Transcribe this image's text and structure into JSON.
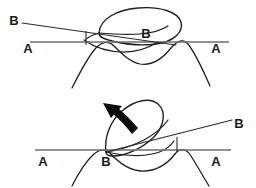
{
  "figure": {
    "background_color": "#ffffff",
    "ink_color": "#1d1d1d",
    "axis_color": "#6f6f6f",
    "panels": [
      {
        "id": "top-panel",
        "name": "upper-diagram",
        "description": "Closed loop resting on a wavy contour with a shallow tilted B line crossing horizontal A line",
        "labels": [
          {
            "id": "top-b-left",
            "text": "B",
            "x": 14,
            "y": 22
          },
          {
            "id": "top-a-left",
            "text": "A",
            "x": 28,
            "y": 50
          },
          {
            "id": "top-b-loop",
            "text": "B",
            "x": 146,
            "y": 35
          },
          {
            "id": "top-a-right",
            "text": "A",
            "x": 216,
            "y": 50
          }
        ],
        "a_line": {
          "x1": 30,
          "y1": 42,
          "x2": 229,
          "y2": 42
        },
        "b_line": {
          "x1": 22,
          "y1": 23,
          "x2": 176,
          "y2": 45
        },
        "tick": {
          "x": 86,
          "y1": 31,
          "y2": 45
        },
        "arrow": null
      },
      {
        "id": "bottom-panel",
        "name": "lower-diagram",
        "description": "Same loop rotated upright with a curved arrow indicating counterclockwise rotation, B line steeply tilted",
        "labels": [
          {
            "id": "bot-a-left",
            "text": "A",
            "x": 43,
            "y": 163
          },
          {
            "id": "bot-b-vertex",
            "text": "B",
            "x": 106,
            "y": 163
          },
          {
            "id": "bot-b-right",
            "text": "B",
            "x": 239,
            "y": 125
          },
          {
            "id": "bot-a-right",
            "text": "A",
            "x": 216,
            "y": 163
          }
        ],
        "a_line": {
          "x1": 35,
          "y1": 150,
          "x2": 231,
          "y2": 150
        },
        "b_line": {
          "x1": 106,
          "y1": 152,
          "x2": 232,
          "y2": 120
        },
        "tick": {
          "x": 177,
          "y1": 137,
          "y2": 152
        },
        "arrow": {
          "id": "rotation-arrow",
          "direction": "counterclockwise-up-left",
          "tip_x": 104,
          "tip_y": 104
        }
      }
    ]
  }
}
